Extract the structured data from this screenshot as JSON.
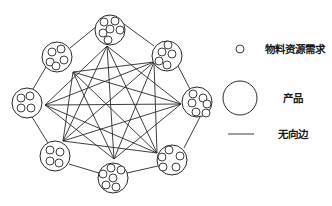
{
  "diagram": {
    "type": "complete-graph",
    "stroke_color": "#2a2a2a",
    "nodes": [
      {
        "id": "top",
        "label": "产品",
        "cx": 110,
        "cy": 30,
        "r": 15,
        "anchor": [
          107,
          46
        ],
        "resources": [
          [
            104,
            22,
            4
          ],
          [
            115,
            21,
            4
          ],
          [
            110,
            29,
            4
          ],
          [
            120,
            30,
            4
          ],
          [
            103,
            33,
            4
          ],
          [
            108,
            40,
            4
          ]
        ]
      },
      {
        "id": "top-right",
        "label": "产品",
        "cx": 167,
        "cy": 56,
        "r": 15,
        "anchor": [
          154,
          62
        ],
        "resources": [
          [
            168,
            45,
            4
          ],
          [
            172,
            54,
            4
          ],
          [
            162,
            52,
            4
          ],
          [
            159,
            61,
            4
          ],
          [
            167,
            65,
            4
          ]
        ]
      },
      {
        "id": "right",
        "label": "产品",
        "cx": 197,
        "cy": 102,
        "r": 15,
        "anchor": [
          181,
          104
        ],
        "resources": [
          [
            193,
            94,
            4
          ],
          [
            203,
            98,
            4
          ],
          [
            192,
            103,
            4
          ],
          [
            207,
            104,
            4
          ],
          [
            196,
            112,
            4
          ],
          [
            206,
            113,
            4
          ]
        ]
      },
      {
        "id": "bottom-right",
        "label": "产品",
        "cx": 172,
        "cy": 160,
        "r": 15,
        "anchor": [
          157,
          153
        ],
        "resources": [
          [
            169,
            150,
            4
          ],
          [
            180,
            156,
            4
          ],
          [
            162,
            157,
            4
          ],
          [
            163,
            167,
            4
          ],
          [
            176,
            167,
            4
          ]
        ]
      },
      {
        "id": "bottom",
        "label": "产品",
        "cx": 113,
        "cy": 178,
        "r": 15,
        "anchor": [
          114,
          159
        ],
        "resources": [
          [
            111,
            168,
            4
          ],
          [
            121,
            170,
            4
          ],
          [
            103,
            174,
            4
          ],
          [
            113,
            178,
            4
          ],
          [
            106,
            185,
            4
          ],
          [
            116,
            187,
            4
          ]
        ]
      },
      {
        "id": "bottom-left",
        "label": "产品",
        "cx": 55,
        "cy": 156,
        "r": 15,
        "anchor": [
          63,
          141
        ],
        "resources": [
          [
            50,
            150,
            4
          ],
          [
            60,
            152,
            4
          ],
          [
            50,
            161,
            4
          ],
          [
            59,
            163,
            4
          ]
        ]
      },
      {
        "id": "left",
        "label": "产品",
        "cx": 27,
        "cy": 103,
        "r": 15,
        "anchor": [
          45,
          105
        ],
        "resources": [
          [
            21,
            98,
            4
          ],
          [
            30,
            96,
            4
          ],
          [
            21,
            108,
            4
          ],
          [
            31,
            108,
            4
          ]
        ]
      },
      {
        "id": "top-left",
        "label": "产品",
        "cx": 57,
        "cy": 57,
        "r": 15,
        "anchor": [
          73,
          72
        ],
        "resources": [
          [
            52,
            52,
            4
          ],
          [
            61,
            49,
            4
          ],
          [
            50,
            62,
            4
          ],
          [
            64,
            60,
            4
          ],
          [
            56,
            66,
            4
          ]
        ]
      }
    ],
    "ring_edges": [
      {
        "from": [
          97,
          26
        ],
        "to": [
          70,
          48
        ]
      },
      {
        "from": [
          124,
          24
        ],
        "to": [
          154,
          46
        ]
      },
      {
        "from": [
          178,
          66
        ],
        "to": [
          190,
          89
        ]
      },
      {
        "from": [
          200,
          117
        ],
        "to": [
          184,
          148
        ]
      },
      {
        "from": [
          158,
          166
        ],
        "to": [
          127,
          173
        ]
      },
      {
        "from": [
          99,
          173
        ],
        "to": [
          69,
          164
        ]
      },
      {
        "from": [
          48,
          143
        ],
        "to": [
          32,
          117
        ]
      },
      {
        "from": [
          33,
          89
        ],
        "to": [
          46,
          67
        ]
      }
    ],
    "inner_edges": [
      {
        "from": "top",
        "to": "right"
      },
      {
        "from": "top",
        "to": "bottom-right"
      },
      {
        "from": "top",
        "to": "bottom"
      },
      {
        "from": "top",
        "to": "bottom-left"
      },
      {
        "from": "top",
        "to": "left"
      },
      {
        "from": "top-right",
        "to": "bottom-right"
      },
      {
        "from": "top-right",
        "to": "bottom"
      },
      {
        "from": "top-right",
        "to": "bottom-left"
      },
      {
        "from": "top-right",
        "to": "left"
      },
      {
        "from": "top-right",
        "to": "top-left"
      },
      {
        "from": "right",
        "to": "bottom"
      },
      {
        "from": "right",
        "to": "bottom-left"
      },
      {
        "from": "right",
        "to": "left"
      },
      {
        "from": "right",
        "to": "top-left"
      },
      {
        "from": "bottom-right",
        "to": "bottom-left"
      },
      {
        "from": "bottom-right",
        "to": "left"
      },
      {
        "from": "bottom-right",
        "to": "top-left"
      },
      {
        "from": "bottom",
        "to": "left"
      },
      {
        "from": "bottom",
        "to": "top-left"
      },
      {
        "from": "bottom-left",
        "to": "top-left"
      }
    ]
  },
  "legend": {
    "items": [
      {
        "symbol": "small-circle",
        "label": "物料资源需求",
        "shape": {
          "cx": 240,
          "cy": 49,
          "r": 4
        },
        "text_pos": {
          "x": 265,
          "y": 49
        }
      },
      {
        "symbol": "large-circle",
        "label": "产品",
        "shape": {
          "cx": 240,
          "cy": 98,
          "r": 17
        },
        "text_pos": {
          "x": 283,
          "y": 98
        }
      },
      {
        "symbol": "line",
        "label": "无向边",
        "shape": {
          "x1": 228,
          "y1": 134,
          "x2": 254,
          "y2": 134
        },
        "text_pos": {
          "x": 278,
          "y": 134
        }
      }
    ]
  }
}
